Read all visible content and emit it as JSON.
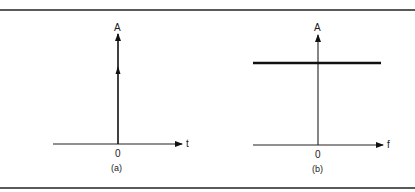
{
  "figure": {
    "panels": [
      {
        "id": "a",
        "caption": "(a)",
        "y_label": "A",
        "x_label": "t",
        "origin_label": "0",
        "signal": "impulse at t = 0 (delta function, amplitude A)"
      },
      {
        "id": "b",
        "caption": "(b)",
        "y_label": "A",
        "x_label": "f",
        "origin_label": "0",
        "signal": "constant flat spectrum of amplitude A across all f"
      }
    ]
  },
  "colors": {
    "line": "#111111",
    "border": "#5a5a5a",
    "background": "#ffffff"
  }
}
